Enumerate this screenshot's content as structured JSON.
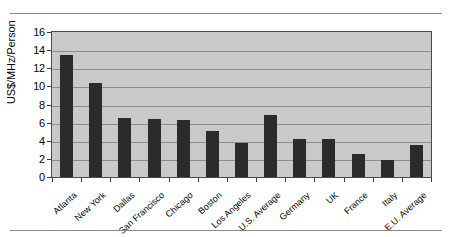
{
  "chart_data": {
    "type": "bar",
    "title": "",
    "subtitle": "",
    "xlabel": "",
    "ylabel": "US$/MHz/Person",
    "ylim": [
      0,
      16
    ],
    "yticks": [
      0,
      2,
      4,
      6,
      8,
      10,
      12,
      14,
      16
    ],
    "grid": true,
    "legend": false,
    "legend_position": "none",
    "bar_color": "#2b2b2b",
    "plot_background": "#c9c9c9",
    "categories": [
      "Atlanta",
      "New York",
      "Dallas",
      "San Francisco",
      "Chicago",
      "Boston",
      "Los Angeles",
      "U.S. Average",
      "Germany",
      "UK",
      "France",
      "Italy",
      "E.U. Average"
    ],
    "values": [
      13.5,
      10.4,
      6.5,
      6.4,
      6.3,
      5.1,
      3.7,
      6.8,
      4.2,
      4.2,
      2.5,
      1.9,
      3.5
    ]
  },
  "figure": {
    "top_rule": "",
    "bottom_rule": ""
  }
}
